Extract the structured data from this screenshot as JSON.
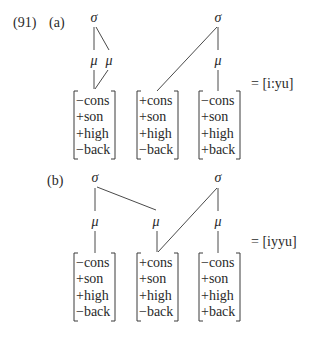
{
  "example": {
    "number": "(91)",
    "parts": [
      {
        "label": "(a)",
        "label_pos": [
          49,
          27
        ],
        "result": "= [i:yu]",
        "result_pos": [
          251,
          88
        ],
        "nodes": [
          {
            "sym": "σ",
            "x": 94,
            "y": 22
          },
          {
            "sym": "σ",
            "x": 218,
            "y": 22
          },
          {
            "sym": "μ",
            "x": 94,
            "y": 65
          },
          {
            "sym": "μ",
            "x": 109,
            "y": 65
          },
          {
            "sym": "μ",
            "x": 218,
            "y": 65
          }
        ],
        "lines": [
          [
            94,
            27,
            94,
            50
          ],
          [
            96,
            27,
            109,
            50
          ],
          [
            94,
            70,
            94,
            89
          ],
          [
            108,
            70,
            95,
            89
          ],
          [
            217,
            27,
            157,
            91
          ],
          [
            218,
            27,
            218,
            50
          ],
          [
            218,
            70,
            218,
            91
          ]
        ],
        "bracket_top": 91,
        "segments": [
          {
            "x": 74,
            "w": 41,
            "features": [
              "−cons",
              "+son",
              "+high",
              "−back"
            ]
          },
          {
            "x": 137,
            "w": 41,
            "features": [
              "+cons",
              "+son",
              "+high",
              "−back"
            ]
          },
          {
            "x": 199,
            "w": 41,
            "features": [
              "−cons",
              "+son",
              "+high",
              "+back"
            ]
          }
        ]
      },
      {
        "label": "(b)",
        "label_pos": [
          47,
          185
        ],
        "result": "= [iyyu]",
        "result_pos": [
          251,
          246
        ],
        "nodes": [
          {
            "sym": "σ",
            "x": 95,
            "y": 182
          },
          {
            "sym": "σ",
            "x": 218,
            "y": 182
          },
          {
            "sym": "μ",
            "x": 95,
            "y": 226
          },
          {
            "sym": "μ",
            "x": 156,
            "y": 226
          },
          {
            "sym": "μ",
            "x": 218,
            "y": 226
          }
        ],
        "lines": [
          [
            95,
            188,
            95,
            211
          ],
          [
            97,
            187,
            156,
            210
          ],
          [
            95,
            231,
            95,
            253
          ],
          [
            157,
            231,
            157,
            252
          ],
          [
            217,
            188,
            158,
            252
          ],
          [
            218,
            188,
            218,
            211
          ],
          [
            218,
            231,
            218,
            253
          ]
        ],
        "bracket_top": 253,
        "segments": [
          {
            "x": 74,
            "w": 41,
            "features": [
              "−cons",
              "+son",
              "+high",
              "−back"
            ]
          },
          {
            "x": 137,
            "w": 41,
            "features": [
              "+cons",
              "+son",
              "+high",
              "−back"
            ]
          },
          {
            "x": 199,
            "w": 41,
            "features": [
              "−cons",
              "+son",
              "+high",
              "+back"
            ]
          }
        ]
      }
    ]
  }
}
